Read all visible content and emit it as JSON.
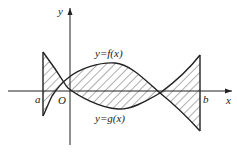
{
  "figure": {
    "axes": {
      "x_label": "x",
      "y_label": "y",
      "origin_label": "O"
    },
    "bounds": {
      "left_label": "a",
      "right_label": "b"
    },
    "curves": {
      "f_label": "y=f(x)",
      "g_label": "y=g(x)"
    },
    "shading": "hatched region between f and g on [a,b]"
  }
}
